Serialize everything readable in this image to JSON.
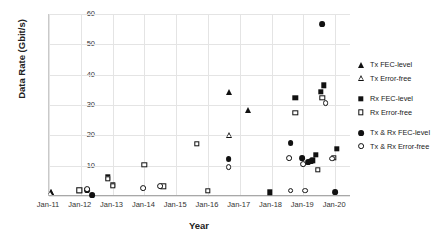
{
  "chart_data": {
    "type": "scatter",
    "title": "",
    "xlabel": "Year",
    "ylabel": "Data Rate (Gbit/s)",
    "xlim": [
      2011.0,
      2020.5
    ],
    "ylim": [
      0,
      60
    ],
    "yticks": [
      0,
      10,
      20,
      30,
      40,
      50,
      60
    ],
    "xticks": [
      "Jan-11",
      "Jan-12",
      "Jan-13",
      "Jan-14",
      "Jan-15",
      "Jan-16",
      "Jan-17",
      "Jan-18",
      "Jan-19",
      "Jan-20"
    ],
    "grid": true,
    "legend_position": "right",
    "series": [
      {
        "name": "Tx FEC-level",
        "marker": "triangle-filled",
        "points": [
          {
            "x": 2011.05,
            "y": 1.2
          },
          {
            "x": 2016.65,
            "y": 34.4
          },
          {
            "x": 2017.25,
            "y": 28.2
          }
        ]
      },
      {
        "name": "Tx Error-free",
        "marker": "triangle-open",
        "points": [
          {
            "x": 2011.05,
            "y": 1.2
          },
          {
            "x": 2016.65,
            "y": 22.2
          }
        ]
      },
      {
        "name": "Rx FEC-level",
        "marker": "square-filled",
        "points": [
          {
            "x": 2011.95,
            "y": 1.9
          },
          {
            "x": 2012.85,
            "y": 6.1
          },
          {
            "x": 2013.0,
            "y": 3.6
          },
          {
            "x": 2017.95,
            "y": 1.2
          },
          {
            "x": 2018.75,
            "y": 32.4
          },
          {
            "x": 2019.55,
            "y": 34.3
          },
          {
            "x": 2019.65,
            "y": 36.5
          },
          {
            "x": 2019.4,
            "y": 13.5
          },
          {
            "x": 2019.3,
            "y": 11.8
          },
          {
            "x": 2020.05,
            "y": 15.5
          }
        ]
      },
      {
        "name": "Rx Error-free",
        "marker": "square-open",
        "points": [
          {
            "x": 2011.95,
            "y": 1.9
          },
          {
            "x": 2012.85,
            "y": 5.6
          },
          {
            "x": 2013.0,
            "y": 3.4
          },
          {
            "x": 2014.0,
            "y": 10.2
          },
          {
            "x": 2014.6,
            "y": 3.2
          },
          {
            "x": 2015.65,
            "y": 17.2
          },
          {
            "x": 2016.0,
            "y": 1.7
          },
          {
            "x": 2018.75,
            "y": 27.4
          },
          {
            "x": 2019.6,
            "y": 32.4
          },
          {
            "x": 2019.45,
            "y": 8.6
          },
          {
            "x": 2019.95,
            "y": 12.5
          }
        ]
      },
      {
        "name": "Tx & Rx FEC-level",
        "marker": "circle-filled",
        "points": [
          {
            "x": 2012.2,
            "y": 1.9
          },
          {
            "x": 2012.35,
            "y": 0.4
          },
          {
            "x": 2016.65,
            "y": 12.2
          },
          {
            "x": 2018.6,
            "y": 17.4
          },
          {
            "x": 2018.95,
            "y": 12.5
          },
          {
            "x": 2019.15,
            "y": 11.2
          },
          {
            "x": 2019.25,
            "y": 11.6
          },
          {
            "x": 2019.6,
            "y": 56.6
          },
          {
            "x": 2020.0,
            "y": 1.4
          }
        ]
      },
      {
        "name": "Tx & Rx Error-free",
        "marker": "circle-open",
        "points": [
          {
            "x": 2012.2,
            "y": 2.4
          },
          {
            "x": 2013.95,
            "y": 2.7
          },
          {
            "x": 2014.5,
            "y": 3.2
          },
          {
            "x": 2016.65,
            "y": 9.4
          },
          {
            "x": 2018.55,
            "y": 12.4
          },
          {
            "x": 2018.6,
            "y": 1.8
          },
          {
            "x": 2019.0,
            "y": 10.4
          },
          {
            "x": 2019.05,
            "y": 1.8
          },
          {
            "x": 2019.7,
            "y": 30.6
          },
          {
            "x": 2019.9,
            "y": 12.3
          }
        ]
      }
    ]
  },
  "legend": {
    "entries": [
      {
        "label": "Tx FEC-level",
        "marker": "triangle-filled"
      },
      {
        "label": "Tx Error-free",
        "marker": "triangle-open"
      },
      {
        "label": "Rx FEC-level",
        "marker": "square-filled"
      },
      {
        "label": "Rx Error-free",
        "marker": "square-open"
      },
      {
        "label": "Tx & Rx FEC-level",
        "marker": "circle-filled"
      },
      {
        "label": "Tx & Rx Error-free",
        "marker": "circle-open"
      }
    ]
  },
  "colors": {
    "marker": "#111111",
    "grid": "#e4e4e4",
    "axis": "#a8a8a8",
    "text": "#222222",
    "background": "#ffffff"
  }
}
